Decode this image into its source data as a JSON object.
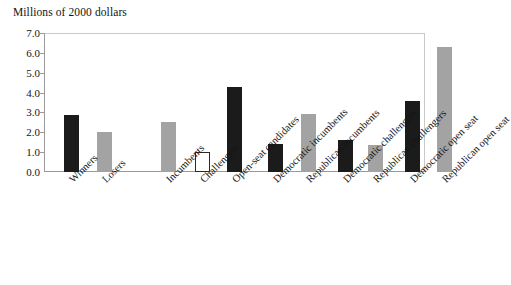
{
  "chart_data": {
    "type": "bar",
    "title": "Millions of 2000 dollars",
    "xlabel": "",
    "ylabel": "",
    "ylim": [
      0.0,
      7.0
    ],
    "ytick_labels": [
      "7.0",
      "6.0",
      "5.0",
      "4.0",
      "3.0",
      "2.0",
      "1.0",
      "0.0"
    ],
    "ytick_values": [
      7.0,
      6.0,
      5.0,
      4.0,
      3.0,
      2.0,
      1.0,
      0.0
    ],
    "grid": false,
    "legend": "none",
    "categories": [
      "Winners",
      "Losers",
      "Incumbents",
      "Challengers",
      "Open-seat candidates",
      "Democratic incumbents",
      "Republican incumbents",
      "Democratic challengers",
      "Republican challengers",
      "Democratic open seat",
      "Republican open seat"
    ],
    "values": [
      2.85,
      2.0,
      2.5,
      1.0,
      4.3,
      1.4,
      2.9,
      1.6,
      1.35,
      3.6,
      6.3
    ],
    "bar_colors": [
      "#1b1b1b",
      "#a3a3a3",
      "#a3a3a3",
      "#ffffff",
      "#1b1b1b",
      "#1b1b1b",
      "#a3a3a3",
      "#1b1b1b",
      "#a3a3a3",
      "#1b1b1b",
      "#a3a3a3"
    ],
    "bar_styles": [
      "black",
      "gray",
      "gray",
      "white",
      "black",
      "black",
      "gray",
      "black",
      "gray",
      "black",
      "gray"
    ],
    "bars": [
      {
        "category": "Winners",
        "value": 2.85,
        "style": "black"
      },
      {
        "category": "Losers",
        "value": 2.0,
        "style": "gray"
      },
      {
        "category": "Incumbents",
        "value": 2.5,
        "style": "gray"
      },
      {
        "category": "Challengers",
        "value": 1.0,
        "style": "white"
      },
      {
        "category": "Open-seat candidates",
        "value": 4.3,
        "style": "black"
      },
      {
        "category": "Democratic incumbents",
        "value": 1.4,
        "style": "black"
      },
      {
        "category": "Republican incumbents",
        "value": 2.9,
        "style": "gray"
      },
      {
        "category": "Democratic challengers",
        "value": 1.6,
        "style": "black"
      },
      {
        "category": "Republican challengers",
        "value": 1.35,
        "style": "gray"
      },
      {
        "category": "Democratic open seat",
        "value": 3.6,
        "style": "black"
      },
      {
        "category": "Republican open seat",
        "value": 6.3,
        "style": "gray"
      }
    ]
  },
  "colors": {
    "black_bar": "#1b1b1b",
    "gray_bar": "#a3a3a3",
    "white_bar_fill": "#ffffff",
    "white_bar_border": "#2a2a2a",
    "axis": "#9a9a9a",
    "frame": "#c9c9c9",
    "text": "#141414",
    "background": "#ffffff"
  }
}
